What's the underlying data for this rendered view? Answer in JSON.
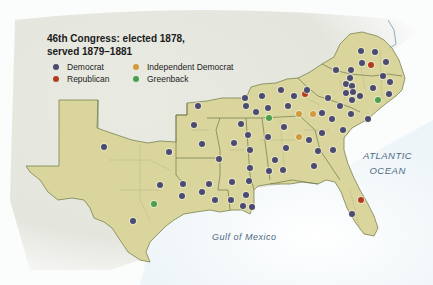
{
  "title": {
    "line1": "46th Congress: elected 1878,",
    "line2": "served 1879–1881"
  },
  "legend": [
    {
      "label": "Democrat",
      "color": "#4b4a72"
    },
    {
      "label": "Republican",
      "color": "#b53a1f"
    },
    {
      "label": "Independent Democrat",
      "color": "#d39a3c"
    },
    {
      "label": "Greenback",
      "color": "#4aa04a"
    }
  ],
  "labels": {
    "atlantic_line1": "ATLANTIC",
    "atlantic_line2": "OCEAN",
    "gulf": "Gulf of Mexico"
  },
  "colors": {
    "land": "#d8d49a",
    "border": "#6e7a4a",
    "water": "#e8f2f7",
    "relief": "#e6e6df"
  },
  "dots": [
    {
      "x": 104,
      "y": 147,
      "party": "Democrat"
    },
    {
      "x": 169,
      "y": 152,
      "party": "Democrat"
    },
    {
      "x": 160,
      "y": 185,
      "party": "Democrat"
    },
    {
      "x": 183,
      "y": 184,
      "party": "Democrat"
    },
    {
      "x": 154,
      "y": 204,
      "party": "Greenback"
    },
    {
      "x": 133,
      "y": 221,
      "party": "Democrat"
    },
    {
      "x": 198,
      "y": 106,
      "party": "Democrat"
    },
    {
      "x": 194,
      "y": 125,
      "party": "Democrat"
    },
    {
      "x": 202,
      "y": 144,
      "party": "Democrat"
    },
    {
      "x": 209,
      "y": 184,
      "party": "Democrat"
    },
    {
      "x": 182,
      "y": 196,
      "party": "Democrat"
    },
    {
      "x": 202,
      "y": 192,
      "party": "Democrat"
    },
    {
      "x": 234,
      "y": 143,
      "party": "Democrat"
    },
    {
      "x": 219,
      "y": 159,
      "party": "Democrat"
    },
    {
      "x": 232,
      "y": 182,
      "party": "Democrat"
    },
    {
      "x": 215,
      "y": 200,
      "party": "Democrat"
    },
    {
      "x": 231,
      "y": 200,
      "party": "Democrat"
    },
    {
      "x": 246,
      "y": 195,
      "party": "Democrat"
    },
    {
      "x": 243,
      "y": 206,
      "party": "Democrat"
    },
    {
      "x": 252,
      "y": 207,
      "party": "Democrat"
    },
    {
      "x": 246,
      "y": 106,
      "party": "Democrat"
    },
    {
      "x": 241,
      "y": 124,
      "party": "Democrat"
    },
    {
      "x": 248,
      "y": 135,
      "party": "Democrat"
    },
    {
      "x": 250,
      "y": 150,
      "party": "Democrat"
    },
    {
      "x": 250,
      "y": 168,
      "party": "Democrat"
    },
    {
      "x": 249,
      "y": 181,
      "party": "Democrat"
    },
    {
      "x": 245,
      "y": 98,
      "party": "Democrat"
    },
    {
      "x": 262,
      "y": 96,
      "party": "Democrat"
    },
    {
      "x": 256,
      "y": 112,
      "party": "Democrat"
    },
    {
      "x": 269,
      "y": 118,
      "party": "Greenback"
    },
    {
      "x": 268,
      "y": 108,
      "party": "Democrat"
    },
    {
      "x": 288,
      "y": 106,
      "party": "Democrat"
    },
    {
      "x": 281,
      "y": 90,
      "party": "Democrat"
    },
    {
      "x": 294,
      "y": 96,
      "party": "Democrat"
    },
    {
      "x": 305,
      "y": 94,
      "party": "Republican"
    },
    {
      "x": 307,
      "y": 90,
      "party": "Democrat"
    },
    {
      "x": 299,
      "y": 114,
      "party": "Independent Democrat"
    },
    {
      "x": 313,
      "y": 114,
      "party": "Independent Democrat"
    },
    {
      "x": 299,
      "y": 137,
      "party": "Independent Democrat"
    },
    {
      "x": 284,
      "y": 127,
      "party": "Democrat"
    },
    {
      "x": 268,
      "y": 137,
      "party": "Democrat"
    },
    {
      "x": 286,
      "y": 148,
      "party": "Democrat"
    },
    {
      "x": 275,
      "y": 160,
      "party": "Democrat"
    },
    {
      "x": 269,
      "y": 171,
      "party": "Democrat"
    },
    {
      "x": 283,
      "y": 170,
      "party": "Democrat"
    },
    {
      "x": 309,
      "y": 140,
      "party": "Democrat"
    },
    {
      "x": 318,
      "y": 151,
      "party": "Democrat"
    },
    {
      "x": 314,
      "y": 166,
      "party": "Democrat"
    },
    {
      "x": 328,
      "y": 98,
      "party": "Democrat"
    },
    {
      "x": 322,
      "y": 113,
      "party": "Democrat"
    },
    {
      "x": 332,
      "y": 119,
      "party": "Democrat"
    },
    {
      "x": 340,
      "y": 106,
      "party": "Democrat"
    },
    {
      "x": 346,
      "y": 93,
      "party": "Democrat"
    },
    {
      "x": 343,
      "y": 130,
      "party": "Democrat"
    },
    {
      "x": 351,
      "y": 114,
      "party": "Democrat"
    },
    {
      "x": 322,
      "y": 133,
      "party": "Democrat"
    },
    {
      "x": 336,
      "y": 70,
      "party": "Democrat"
    },
    {
      "x": 351,
      "y": 70,
      "party": "Democrat"
    },
    {
      "x": 346,
      "y": 84,
      "party": "Democrat"
    },
    {
      "x": 350,
      "y": 78,
      "party": "Democrat"
    },
    {
      "x": 352,
      "y": 86,
      "party": "Democrat"
    },
    {
      "x": 361,
      "y": 51,
      "party": "Democrat"
    },
    {
      "x": 375,
      "y": 52,
      "party": "Democrat"
    },
    {
      "x": 362,
      "y": 63,
      "party": "Democrat"
    },
    {
      "x": 371,
      "y": 65,
      "party": "Republican"
    },
    {
      "x": 386,
      "y": 62,
      "party": "Democrat"
    },
    {
      "x": 383,
      "y": 76,
      "party": "Democrat"
    },
    {
      "x": 352,
      "y": 100,
      "party": "Democrat"
    },
    {
      "x": 373,
      "y": 88,
      "party": "Democrat"
    },
    {
      "x": 360,
      "y": 96,
      "party": "Democrat"
    },
    {
      "x": 390,
      "y": 82,
      "party": "Democrat"
    },
    {
      "x": 389,
      "y": 94,
      "party": "Democrat"
    },
    {
      "x": 379,
      "y": 100,
      "party": "Green"
    },
    {
      "x": 378,
      "y": 100,
      "party": "Greenback"
    },
    {
      "x": 368,
      "y": 119,
      "party": "Democrat"
    },
    {
      "x": 353,
      "y": 92,
      "party": "Democrat"
    },
    {
      "x": 333,
      "y": 150,
      "party": "Democrat"
    },
    {
      "x": 361,
      "y": 200,
      "party": "Republican"
    },
    {
      "x": 352,
      "y": 214,
      "party": "Democrat"
    }
  ]
}
